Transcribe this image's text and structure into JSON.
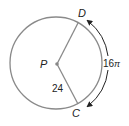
{
  "diagram": {
    "type": "circle-arc-length",
    "center": {
      "label": "P"
    },
    "points": [
      {
        "label": "D"
      },
      {
        "label": "C"
      }
    ],
    "radius_label": "24",
    "arc_label_number": "16",
    "arc_label_symbol": "π",
    "colors": {
      "circle": "#8a8a8a",
      "radius": "#8a8a8a",
      "arrow": "#222222",
      "text": "#222222"
    }
  }
}
